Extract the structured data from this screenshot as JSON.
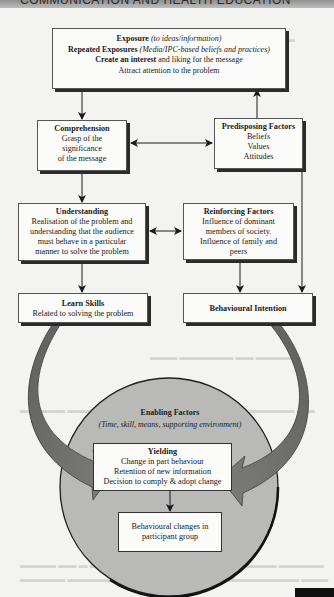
{
  "header": {
    "text": "COMMUNICATION AND HEALTH EDUCATION"
  },
  "colors": {
    "page_bg": "#f3f3f1",
    "box_bg": "#fbfbfa",
    "box_shadow": "#2b2b2b",
    "circle_fill": "#b9b9b7",
    "curved_arrow_fill": "#6f6f6d",
    "line": "#1a1a1a"
  },
  "nodes": {
    "exposure": {
      "line1_bold": "Exposure",
      "line1_italic": "(to ideas/information)",
      "line2_bold": "Repeated Exposures",
      "line2_italic": "(Media/IPC-based beliefs and practices)",
      "line3_bold": "Create an interest",
      "line3_rest": "and liking for the message",
      "line4": "Attract attention to the problem"
    },
    "comprehension": {
      "title": "Comprehension",
      "lines": [
        "Grasp of the",
        "significance",
        "of the message"
      ]
    },
    "predisposing": {
      "title": "Predisposing Factors",
      "lines": [
        "Beliefs",
        "Values",
        "Attitudes"
      ]
    },
    "understanding": {
      "title": "Understanding",
      "lines": [
        "Realisation of the problem and",
        "understanding that the audience",
        "must behave in a particular",
        "manner to solve the problem"
      ]
    },
    "reinforcing": {
      "title": "Reinforcing Factors",
      "lines": [
        "Influence of dominant",
        "members of society.",
        "Influence of family and",
        "peers"
      ]
    },
    "learn_skills": {
      "title": "Learn Skills",
      "lines": [
        "Related to solving the problem"
      ]
    },
    "behavioural_intention": {
      "title": "Behavioural Intention"
    },
    "enabling": {
      "title": "Enabling Factors",
      "subtitle": "(Time, skill, means, supporting environment)"
    },
    "yielding": {
      "title": "Yielding",
      "lines": [
        "Change in part behaviour",
        "Retention of new information",
        "Decision to comply & adopt change"
      ]
    },
    "behavioural_changes": {
      "lines": [
        "Behavioural changes in",
        "participant group"
      ]
    }
  },
  "edges": [
    {
      "from": "exposure",
      "to": "comprehension",
      "type": "arrow"
    },
    {
      "from": "predisposing",
      "to": "exposure",
      "type": "arrow"
    },
    {
      "from": "comprehension",
      "to": "predisposing",
      "type": "bidirectional"
    },
    {
      "from": "comprehension",
      "to": "understanding",
      "type": "arrow"
    },
    {
      "from": "understanding",
      "to": "reinforcing",
      "type": "bidirectional"
    },
    {
      "from": "understanding",
      "to": "learn_skills",
      "type": "arrow"
    },
    {
      "from": "reinforcing",
      "to": "behavioural_intention",
      "type": "arrow"
    },
    {
      "from": "predisposing",
      "to": "behavioural_intention",
      "type": "arrow"
    },
    {
      "from": "learn_skills",
      "to": "yielding",
      "type": "curved-arrow"
    },
    {
      "from": "behavioural_intention",
      "to": "yielding",
      "type": "curved-arrow"
    },
    {
      "from": "yielding",
      "to": "behavioural_changes",
      "type": "arrow"
    }
  ]
}
